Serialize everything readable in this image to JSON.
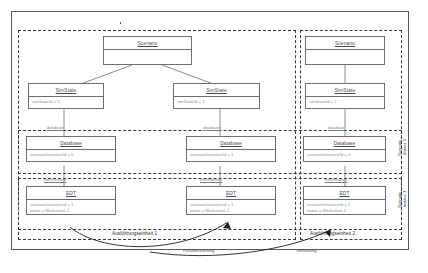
{
  "diagram": {
    "kind_keyword": "object",
    "title": "Distributed SimStates Example",
    "frame_label": "object Distributed SimStates Example"
  },
  "objects": {
    "scenario_left": {
      "name": "Scenario",
      "attributes": []
    },
    "scenario_right": {
      "name": "Scenario",
      "attributes": []
    },
    "simstate_0": {
      "name": "SimState",
      "attributes": [
        "simStateId = 0"
      ]
    },
    "simstate_1": {
      "name": "SimState",
      "attributes": [
        "simStateId = 1"
      ]
    },
    "simstate_2": {
      "name": "SimState",
      "attributes": [
        "simStateId = 2"
      ]
    },
    "database_0": {
      "name": "Database",
      "attributes": [
        "scenarioInstanceId = 0"
      ]
    },
    "database_1": {
      "name": "Database",
      "attributes": [
        "scenarioInstanceId = 1"
      ]
    },
    "database_2": {
      "name": "Database",
      "attributes": [
        "scenarioInstanceId = 0"
      ]
    },
    "edt_0": {
      "name": "EDT",
      "attributes": [
        "scenarioInstanceId = 1",
        "name = Werkstück 2"
      ]
    },
    "edt_1": {
      "name": "EDT",
      "attributes": [
        "scenarioInstanceId = 1",
        "name = Werkstück 2"
      ]
    },
    "edt_2": {
      "name": "EDT",
      "attributes": [
        "scenarioInstanceId = 1",
        "name = Werkstück 2"
      ]
    }
  },
  "link_labels": {
    "database_left": "database",
    "database_middle": "database",
    "database_right": "database",
    "edt_left": "nonInstance",
    "edt_middle": "nonInstance",
    "edt_right": "nonInstance"
  },
  "region_labels": {
    "scenario_instance_top": {
      "line1": "Scenario-",
      "line2": "Instanz 0"
    },
    "scenario_instance_bottom": {
      "line1": "Scenario-",
      "line2": "Instanz 1"
    }
  },
  "annotations": {
    "execution_unit_1": "Ausführungseinheit 1",
    "execution_unit_2": "Ausführungseinheit 2",
    "parallelization": "Parallelisierung",
    "distribution": "Verteilung"
  },
  "colors": {
    "frame_stroke": "#5a5a5a",
    "box_stroke": "#6e6e6e",
    "dashed_stroke": "#3a3a3a",
    "head_text": "#4a4a4a",
    "attr_text": "#8d8d8d",
    "annotation_text": "#1e1e1e",
    "background": "#ffffff"
  }
}
